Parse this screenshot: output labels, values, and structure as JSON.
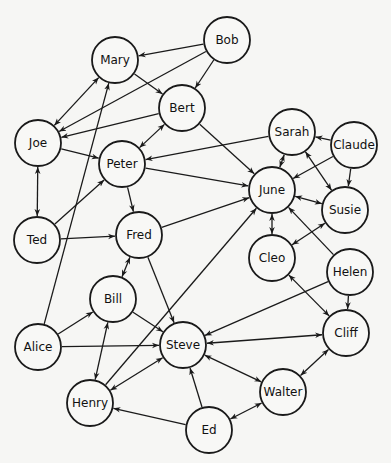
{
  "diagram": {
    "type": "directed-graph",
    "node_radius": 23,
    "colors": {
      "background": "#f6f6f4",
      "stroke": "#1a1a1a",
      "node_fill": "#f8f8f6"
    },
    "nodes": [
      {
        "id": "Mary",
        "label": "Mary",
        "x": 115,
        "y": 60
      },
      {
        "id": "Bob",
        "label": "Bob",
        "x": 227,
        "y": 40
      },
      {
        "id": "Bert",
        "label": "Bert",
        "x": 182,
        "y": 108
      },
      {
        "id": "Joe",
        "label": "Joe",
        "x": 38,
        "y": 143
      },
      {
        "id": "Peter",
        "label": "Peter",
        "x": 122,
        "y": 164
      },
      {
        "id": "Sarah",
        "label": "Sarah",
        "x": 292,
        "y": 132
      },
      {
        "id": "Claude",
        "label": "Claude",
        "x": 354,
        "y": 145
      },
      {
        "id": "June",
        "label": "June",
        "x": 272,
        "y": 190
      },
      {
        "id": "Susie",
        "label": "Susie",
        "x": 345,
        "y": 210
      },
      {
        "id": "Ted",
        "label": "Ted",
        "x": 37,
        "y": 240
      },
      {
        "id": "Fred",
        "label": "Fred",
        "x": 139,
        "y": 235
      },
      {
        "id": "Cleo",
        "label": "Cleo",
        "x": 272,
        "y": 258
      },
      {
        "id": "Helen",
        "label": "Helen",
        "x": 350,
        "y": 272
      },
      {
        "id": "Bill",
        "label": "Bill",
        "x": 113,
        "y": 299
      },
      {
        "id": "Cliff",
        "label": "Cliff",
        "x": 346,
        "y": 333
      },
      {
        "id": "Alice",
        "label": "Alice",
        "x": 38,
        "y": 347
      },
      {
        "id": "Steve",
        "label": "Steve",
        "x": 183,
        "y": 345
      },
      {
        "id": "Walter",
        "label": "Walter",
        "x": 283,
        "y": 392
      },
      {
        "id": "Henry",
        "label": "Henry",
        "x": 90,
        "y": 403
      },
      {
        "id": "Ed",
        "label": "Ed",
        "x": 209,
        "y": 430
      }
    ],
    "edges": [
      {
        "from": "Bob",
        "to": "Mary",
        "bidirectional": false
      },
      {
        "from": "Bob",
        "to": "Joe",
        "bidirectional": false
      },
      {
        "from": "Bob",
        "to": "Bert",
        "bidirectional": false
      },
      {
        "from": "Mary",
        "to": "Bert",
        "bidirectional": false
      },
      {
        "from": "Mary",
        "to": "Joe",
        "bidirectional": true
      },
      {
        "from": "Bert",
        "to": "Joe",
        "bidirectional": false
      },
      {
        "from": "Bert",
        "to": "Peter",
        "bidirectional": true
      },
      {
        "from": "Bert",
        "to": "June",
        "bidirectional": false
      },
      {
        "from": "Joe",
        "to": "Peter",
        "bidirectional": false
      },
      {
        "from": "Joe",
        "to": "Ted",
        "bidirectional": true
      },
      {
        "from": "Sarah",
        "to": "Peter",
        "bidirectional": false
      },
      {
        "from": "Sarah",
        "to": "June",
        "bidirectional": true
      },
      {
        "from": "Sarah",
        "to": "Susie",
        "bidirectional": true
      },
      {
        "from": "Claude",
        "to": "Sarah",
        "bidirectional": false
      },
      {
        "from": "Claude",
        "to": "June",
        "bidirectional": false
      },
      {
        "from": "Claude",
        "to": "Susie",
        "bidirectional": false
      },
      {
        "from": "Peter",
        "to": "June",
        "bidirectional": false
      },
      {
        "from": "Peter",
        "to": "Fred",
        "bidirectional": false
      },
      {
        "from": "Ted",
        "to": "Peter",
        "bidirectional": false
      },
      {
        "from": "Ted",
        "to": "Fred",
        "bidirectional": false
      },
      {
        "from": "Fred",
        "to": "June",
        "bidirectional": false
      },
      {
        "from": "Fred",
        "to": "Steve",
        "bidirectional": false
      },
      {
        "from": "Fred",
        "to": "Bill",
        "bidirectional": true
      },
      {
        "from": "June",
        "to": "Susie",
        "bidirectional": true
      },
      {
        "from": "June",
        "to": "Cleo",
        "bidirectional": true
      },
      {
        "from": "Helen",
        "to": "June",
        "bidirectional": false
      },
      {
        "from": "Susie",
        "to": "Cleo",
        "bidirectional": true
      },
      {
        "from": "Helen",
        "to": "Steve",
        "bidirectional": false
      },
      {
        "from": "Helen",
        "to": "Cliff",
        "bidirectional": false
      },
      {
        "from": "Cleo",
        "to": "Cliff",
        "bidirectional": true
      },
      {
        "from": "Cliff",
        "to": "Steve",
        "bidirectional": true
      },
      {
        "from": "Cliff",
        "to": "Walter",
        "bidirectional": true
      },
      {
        "from": "Alice",
        "to": "Mary",
        "bidirectional": false
      },
      {
        "from": "Alice",
        "to": "Bill",
        "bidirectional": false
      },
      {
        "from": "Alice",
        "to": "Steve",
        "bidirectional": false
      },
      {
        "from": "Bill",
        "to": "Steve",
        "bidirectional": false
      },
      {
        "from": "Bill",
        "to": "Henry",
        "bidirectional": true
      },
      {
        "from": "Henry",
        "to": "June",
        "bidirectional": false
      },
      {
        "from": "Henry",
        "to": "Steve",
        "bidirectional": true
      },
      {
        "from": "Steve",
        "to": "Walter",
        "bidirectional": true
      },
      {
        "from": "Ed",
        "to": "Steve",
        "bidirectional": false
      },
      {
        "from": "Ed",
        "to": "Henry",
        "bidirectional": false
      },
      {
        "from": "Ed",
        "to": "Walter",
        "bidirectional": true
      }
    ]
  }
}
